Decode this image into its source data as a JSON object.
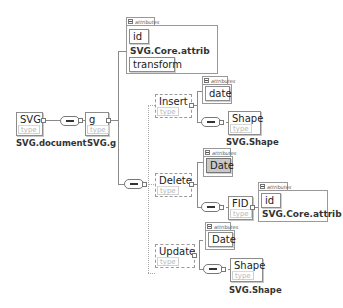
{
  "diagram": {
    "root": {
      "name": "SVG",
      "type_hint": "type",
      "type_label": "SVG.document"
    },
    "g": {
      "name": "g",
      "type_hint": "type",
      "type_label": "SVG.g"
    },
    "g_attributes": {
      "tab": "attributes",
      "items": [
        "id",
        "transform"
      ],
      "group_ref": "SVG.Core.attrib"
    },
    "insert": {
      "name": "Insert",
      "type_hint": "type",
      "attributes_tab": "attributes",
      "attributes": [
        "date"
      ],
      "child": {
        "name": "Shape",
        "type_hint": "type",
        "type_label": "SVG.Shape"
      }
    },
    "delete": {
      "name": "Delete",
      "type_hint": "type",
      "attributes_tab": "attributes",
      "attributes": [
        "Date"
      ],
      "child": {
        "name": "FID",
        "type_hint": "type",
        "attributes_tab": "attributes",
        "attributes": [
          "id"
        ],
        "group_ref": "SVG.Core.attrib"
      }
    },
    "update": {
      "name": "Update",
      "type_hint": "type",
      "attributes_tab": "attributes",
      "attributes": [
        "Date"
      ],
      "child": {
        "name": "Shape",
        "type_hint": "type",
        "type_label": "SVG.Shape"
      }
    },
    "colors": {
      "border": "#8c8c8c",
      "highlight_fill": "#c8c8c8",
      "line": "#8a8a8a"
    }
  }
}
